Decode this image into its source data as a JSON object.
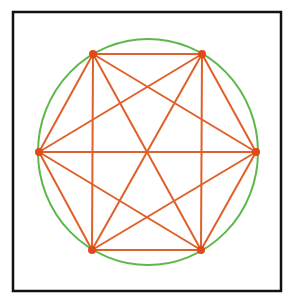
{
  "diagram": {
    "type": "complete-graph-inscribed-hexagon",
    "frame": {
      "x": 13,
      "y": 12,
      "width": 268,
      "height": 279,
      "stroke": "#111111",
      "stroke_width": 2.5
    },
    "circle": {
      "cx": 148,
      "cy": 152,
      "rx": 110,
      "ry": 113,
      "stroke": "#5cb84a",
      "stroke_width": 2
    },
    "edge_color": "#e0602a",
    "edge_width": 2,
    "vertex_color": "#e04a1a",
    "vertex_radius": 4,
    "vertices": [
      {
        "id": "top-left",
        "x": 93,
        "y": 54
      },
      {
        "id": "top-right",
        "x": 202,
        "y": 54
      },
      {
        "id": "right",
        "x": 256,
        "y": 152
      },
      {
        "id": "bottom-right",
        "x": 201,
        "y": 250
      },
      {
        "id": "bottom-left",
        "x": 92,
        "y": 250
      },
      {
        "id": "left",
        "x": 39,
        "y": 152
      }
    ],
    "edges": "all-pairs"
  }
}
